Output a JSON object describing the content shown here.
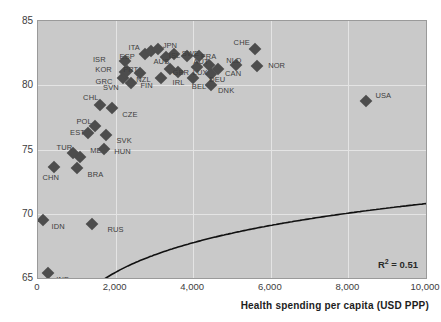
{
  "chart_data": {
    "type": "scatter",
    "title": "",
    "xlabel": "Health spending per capita (USD PPP)",
    "ylabel": "",
    "xlim": [
      0,
      10000
    ],
    "ylim": [
      65,
      85
    ],
    "xticks": [
      "0",
      "2,000",
      "4,000",
      "6,000",
      "8,000",
      "10,000"
    ],
    "xtick_values": [
      0,
      2000,
      4000,
      6000,
      8000,
      10000
    ],
    "yticks": [
      "65",
      "70",
      "75",
      "80",
      "85"
    ],
    "ytick_values": [
      65,
      70,
      75,
      80,
      85
    ],
    "grid": true,
    "legend": null,
    "annotation": "R² = 0.51",
    "annotation_label": "R",
    "annotation_sup": "2",
    "annotation_rest": " = 0.51",
    "trendline": {
      "type": "logarithmic",
      "description": "fitted log curve rising steeply from 0 to ~2000 then flattening"
    },
    "points": [
      {
        "label": "IND",
        "x": 250,
        "y": 65.4,
        "lx": 640,
        "ly": 64.95
      },
      {
        "label": "IDN",
        "x": 130,
        "y": 69.5,
        "lx": 520,
        "ly": 69.05
      },
      {
        "label": "RUS",
        "x": 1400,
        "y": 69.2,
        "lx": 2000,
        "ly": 68.8
      },
      {
        "label": "CHN",
        "x": 420,
        "y": 73.6,
        "lx": 330,
        "ly": 72.85
      },
      {
        "label": "BRA",
        "x": 1010,
        "y": 73.55,
        "lx": 1480,
        "ly": 73.1
      },
      {
        "label": "MEX",
        "x": 1080,
        "y": 74.45,
        "lx": 1560,
        "ly": 74.95
      },
      {
        "label": "TUR",
        "x": 900,
        "y": 74.75,
        "lx": 680,
        "ly": 75.2
      },
      {
        "label": "HUN",
        "x": 1700,
        "y": 75.05,
        "lx": 2180,
        "ly": 74.9
      },
      {
        "label": "EST",
        "x": 1300,
        "y": 76.25,
        "lx": 1020,
        "ly": 76.4
      },
      {
        "label": "SVK",
        "x": 1760,
        "y": 76.1,
        "lx": 2220,
        "ly": 75.75
      },
      {
        "label": "POL",
        "x": 1480,
        "y": 76.85,
        "lx": 1190,
        "ly": 77.25
      },
      {
        "label": "CZE",
        "x": 1920,
        "y": 78.2,
        "lx": 2370,
        "ly": 77.75
      },
      {
        "label": "CHL",
        "x": 1600,
        "y": 78.5,
        "lx": 1360,
        "ly": 79.05
      },
      {
        "label": "SVN",
        "x": 2400,
        "y": 80.15,
        "lx": 1880,
        "ly": 79.85
      },
      {
        "label": "GRC",
        "x": 2190,
        "y": 80.55,
        "lx": 1700,
        "ly": 80.3
      },
      {
        "label": "FIN",
        "x": 3180,
        "y": 80.55,
        "lx": 2800,
        "ly": 80.0
      },
      {
        "label": "DNK",
        "x": 4450,
        "y": 80.0,
        "lx": 4850,
        "ly": 79.6
      },
      {
        "label": "BEL",
        "x": 4000,
        "y": 80.55,
        "lx": 4150,
        "ly": 79.95
      },
      {
        "label": "NZL",
        "x": 2640,
        "y": 80.95,
        "lx": 2720,
        "ly": 80.5
      },
      {
        "label": "KOR",
        "x": 2230,
        "y": 81.05,
        "lx": 1690,
        "ly": 81.25
      },
      {
        "label": "PRT",
        "x": 2300,
        "y": 81.1,
        "lx": 2390,
        "ly": 81.25
      },
      {
        "label": "IRL",
        "x": 3600,
        "y": 81.0,
        "lx": 3620,
        "ly": 80.25
      },
      {
        "label": "CAN",
        "x": 4650,
        "y": 81.3,
        "lx": 5030,
        "ly": 80.95
      },
      {
        "label": "DEU",
        "x": 4450,
        "y": 80.9,
        "lx": 4620,
        "ly": 80.45
      },
      {
        "label": "GBR",
        "x": 3400,
        "y": 81.3,
        "lx": 3680,
        "ly": 81.05
      },
      {
        "label": "LUX",
        "x": 4100,
        "y": 81.45,
        "lx": 4180,
        "ly": 81.0
      },
      {
        "label": "AUT",
        "x": 4400,
        "y": 81.6,
        "lx": 4200,
        "ly": 81.9
      },
      {
        "label": "NLD",
        "x": 5100,
        "y": 81.6,
        "lx": 5050,
        "ly": 81.95
      },
      {
        "label": "ISR",
        "x": 2250,
        "y": 81.9,
        "lx": 1580,
        "ly": 82.05
      },
      {
        "label": "NOR",
        "x": 5650,
        "y": 81.5,
        "lx": 6150,
        "ly": 81.55
      },
      {
        "label": "AUS",
        "x": 3300,
        "y": 82.2,
        "lx": 3180,
        "ly": 81.9
      },
      {
        "label": "ESP",
        "x": 2750,
        "y": 82.4,
        "lx": 2300,
        "ly": 82.3
      },
      {
        "label": "FRA",
        "x": 4150,
        "y": 82.25,
        "lx": 4400,
        "ly": 82.25
      },
      {
        "label": "ISL",
        "x": 3500,
        "y": 82.45,
        "lx": 3520,
        "ly": 82.35
      },
      {
        "label": "SWE",
        "x": 3850,
        "y": 82.3,
        "lx": 3930,
        "ly": 82.5
      },
      {
        "label": "ITA",
        "x": 2900,
        "y": 82.65,
        "lx": 2480,
        "ly": 83.0
      },
      {
        "label": "JPN",
        "x": 3100,
        "y": 82.8,
        "lx": 3400,
        "ly": 83.1
      },
      {
        "label": "CHE",
        "x": 5600,
        "y": 82.85,
        "lx": 5250,
        "ly": 83.4
      },
      {
        "label": "USA",
        "x": 8450,
        "y": 78.8,
        "lx": 8900,
        "ly": 79.25
      }
    ]
  },
  "axis": {
    "x_title": "Health spending per capita (USD PPP)"
  }
}
